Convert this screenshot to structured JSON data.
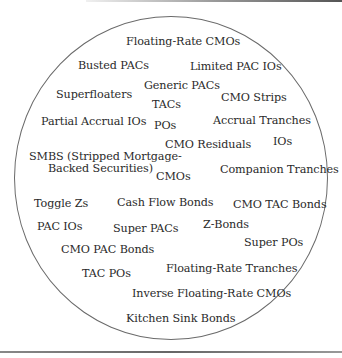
{
  "diagram": {
    "type": "circle-of-terms",
    "labels": [
      {
        "id": "floating-rate-cmos",
        "text": "Floating-Rate CMOs",
        "x": 126,
        "y": 36
      },
      {
        "id": "busted-pacs",
        "text": "Busted PACs",
        "x": 78,
        "y": 60
      },
      {
        "id": "limited-pac-ios",
        "text": "Limited PAC IOs",
        "x": 190,
        "y": 61
      },
      {
        "id": "generic-pacs",
        "text": "Generic PACs",
        "x": 144,
        "y": 80
      },
      {
        "id": "superfloaters",
        "text": "Superfloaters",
        "x": 56,
        "y": 89
      },
      {
        "id": "cmo-strips",
        "text": "CMO Strips",
        "x": 221,
        "y": 92
      },
      {
        "id": "tacs",
        "text": "TACs",
        "x": 152,
        "y": 99
      },
      {
        "id": "partial-accrual-ios",
        "text": "Partial Accrual IOs",
        "x": 41,
        "y": 116
      },
      {
        "id": "pos",
        "text": "POs",
        "x": 154,
        "y": 120
      },
      {
        "id": "accrual-tranches",
        "text": "Accrual Tranches",
        "x": 213,
        "y": 115
      },
      {
        "id": "cmo-residuals",
        "text": "CMO Residuals",
        "x": 165,
        "y": 139
      },
      {
        "id": "ios",
        "text": "IOs",
        "x": 273,
        "y": 136
      },
      {
        "id": "smbs-line1",
        "text": "SMBS (Stripped Mortgage-",
        "x": 29,
        "y": 151
      },
      {
        "id": "smbs-line2",
        "text": "Backed Securities)",
        "x": 48,
        "y": 163
      },
      {
        "id": "companion-tranches",
        "text": "Companion Tranches",
        "x": 220,
        "y": 164
      },
      {
        "id": "cmos",
        "text": "CMOs",
        "x": 156,
        "y": 171
      },
      {
        "id": "toggle-zs",
        "text": "Toggle Zs",
        "x": 34,
        "y": 198
      },
      {
        "id": "cash-flow-bonds",
        "text": "Cash Flow Bonds",
        "x": 117,
        "y": 197
      },
      {
        "id": "cmo-tac-bonds",
        "text": "CMO TAC Bonds",
        "x": 233,
        "y": 199
      },
      {
        "id": "pac-ios",
        "text": "PAC IOs",
        "x": 37,
        "y": 221
      },
      {
        "id": "super-pacs",
        "text": "Super PACs",
        "x": 113,
        "y": 223
      },
      {
        "id": "z-bonds",
        "text": "Z-Bonds",
        "x": 203,
        "y": 219
      },
      {
        "id": "super-pos",
        "text": "Super POs",
        "x": 244,
        "y": 237
      },
      {
        "id": "cmo-pac-bonds",
        "text": "CMO PAC Bonds",
        "x": 61,
        "y": 244
      },
      {
        "id": "tac-pos",
        "text": "TAC POs",
        "x": 82,
        "y": 268
      },
      {
        "id": "floating-rate-tranches",
        "text": "Floating-Rate Tranches",
        "x": 166,
        "y": 263
      },
      {
        "id": "inverse-floating-rate-cmos",
        "text": "Inverse Floating-Rate CMOs",
        "x": 132,
        "y": 288
      },
      {
        "id": "kitchen-sink-bonds",
        "text": "Kitchen Sink Bonds",
        "x": 126,
        "y": 313
      }
    ]
  }
}
